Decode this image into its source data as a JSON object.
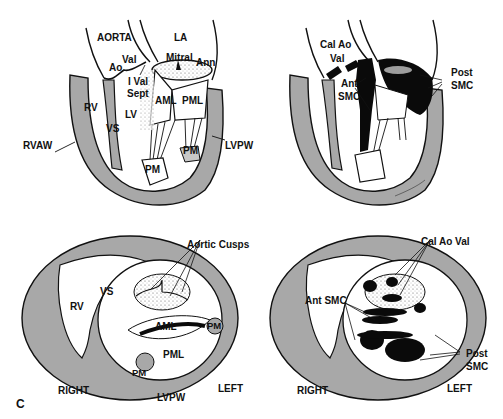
{
  "figure": {
    "panel_letter": "C",
    "colors": {
      "wall": "#a8a8a8",
      "ink": "#111111",
      "calcium": "#0a0a0a",
      "background": "#ffffff"
    }
  },
  "panels": {
    "top_left": {
      "view": "long-axis normal",
      "labels": {
        "aorta": "AORTA",
        "la": "LA",
        "ao": "Ao",
        "val": "Val",
        "mitral": "Mitral",
        "ann": "Ann",
        "i_val": "I Val",
        "sept": "Sept",
        "aml": "AML",
        "pml": "PML",
        "rv": "RV",
        "lv": "LV",
        "vs": "VS",
        "rvaw": "RVAW",
        "lvpw": "LVPW",
        "pm_1": "PM",
        "pm_2": "PM"
      }
    },
    "top_right": {
      "view": "long-axis calcified",
      "labels": {
        "cal_ao": "Cal Ao",
        "val": "Val",
        "ant": "Ant",
        "smc_ant": "SMC",
        "post": "Post",
        "smc_post": "SMC"
      },
      "signature": "Rhesman"
    },
    "bottom_left": {
      "view": "short-axis normal",
      "labels": {
        "aortic_cusps": "Aortic Cusps",
        "rv": "RV",
        "vs": "VS",
        "aml": "AML",
        "pml": "PML",
        "pm_1": "PM",
        "pm_2": "PM",
        "right": "RIGHT",
        "left": "LEFT",
        "lvpw": "LVPW"
      }
    },
    "bottom_right": {
      "view": "short-axis calcified",
      "labels": {
        "cal_ao_val": "Cal Ao Val",
        "ant_smc": "Ant SMC",
        "post": "Post",
        "smc": "SMC",
        "right": "RIGHT",
        "left": "LEFT"
      }
    }
  }
}
